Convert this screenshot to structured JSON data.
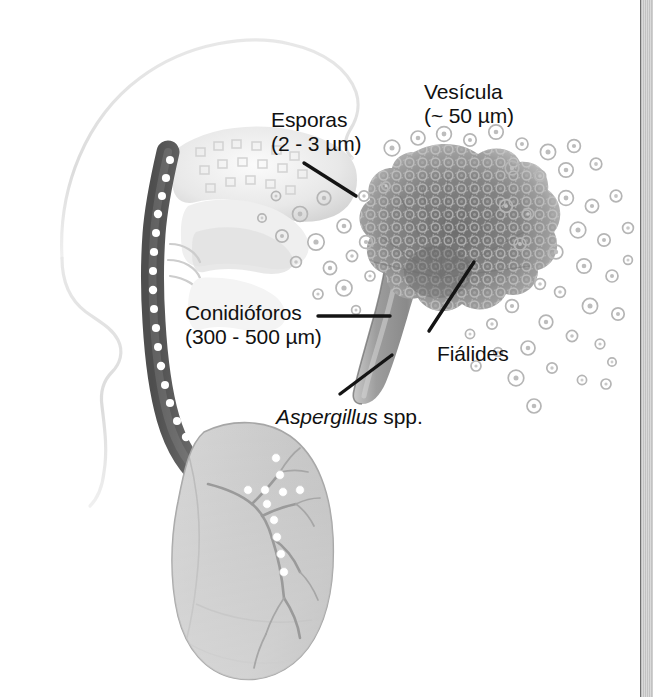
{
  "figure": {
    "background_color": "#ffffff",
    "width": 655,
    "height": 697
  },
  "labels": {
    "esporas": {
      "line1": "Esporas",
      "line2": "(2 - 3 µm)",
      "x": 271,
      "y": 117
    },
    "vesicula": {
      "line1": "Vesícula",
      "line2": "(~ 50 µm)",
      "x": 424,
      "y": 82
    },
    "conidioforos": {
      "line1": "Conidióforos",
      "line2": "(300 - 500 µm)",
      "x": 185,
      "y": 302
    },
    "fialides": {
      "line1": "Fiálides",
      "x": 437,
      "y": 345
    },
    "aspergillus": {
      "genus": "Aspergillus",
      "qualifier": " spp.",
      "x": 276,
      "y": 406
    }
  },
  "colors": {
    "text": "#111111",
    "leader_line": "#1a1a1a",
    "head_outline": "#e3e3e3",
    "airway_dark": "#5e5e5e",
    "airway_light": "#ffffff",
    "lung_fill": "#c4c4c4",
    "lung_edge": "#9a9a9a",
    "conidial_head": "#8a8a8a",
    "conidiophore_stalk": "#8f8f8f",
    "spore_ring": "#b9b9b9",
    "page_edge": "#bfbfbf"
  },
  "anatomy": {
    "head_profile": "lateral head and neck outline",
    "nasal_cavity": "nasal and oral cavity shading",
    "airway": "trachea and bronchus carrying spores",
    "lung": "left lung with bronchial tree",
    "spore_dots_in_airway": 24,
    "bronchial_branches": 9
  },
  "fungus": {
    "conidial_head": "dense radiating mass of conidia (spores)",
    "stalk": "conidiophore stalk widening into vesicle",
    "dispersed_spores": "scattered concentric-ring spores drifting left toward airway and right across the field",
    "dispersed_spore_count": 86
  },
  "page_edge": {
    "present": true,
    "description": "scanned book page edge strip at right margin"
  }
}
